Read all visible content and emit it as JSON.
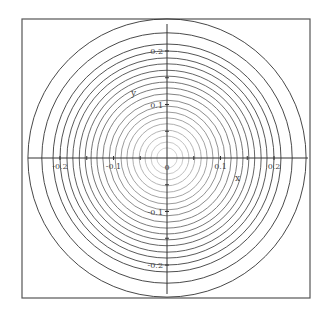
{
  "chart_data": {
    "type": "contour",
    "title": "",
    "xlabel": "x",
    "ylabel": "y",
    "xlim": [
      -0.26,
      0.26
    ],
    "ylim": [
      -0.26,
      0.26
    ],
    "grid": false,
    "legend": null,
    "x_ticks": [
      -0.2,
      -0.15,
      -0.1,
      -0.05,
      0,
      0.05,
      0.1,
      0.15,
      0.2
    ],
    "x_tick_labels": [
      "-0.2",
      "-0.1",
      "0",
      "0.1",
      "0.2"
    ],
    "x_tick_label_values": [
      -0.2,
      -0.1,
      0,
      0.1,
      0.2
    ],
    "y_tick_labels": [
      "0.2",
      "0.1",
      "-0.1",
      "-0.2"
    ],
    "y_tick_label_values": [
      0.2,
      0.1,
      -0.1,
      -0.2
    ],
    "contours": {
      "shape": "concentric circles centered at origin",
      "radii": [
        0.26,
        0.234,
        0.213,
        0.2,
        0.187,
        0.176,
        0.164,
        0.153,
        0.142,
        0.131,
        0.12,
        0.108,
        0.097,
        0.086,
        0.075,
        0.064,
        0.052,
        0.041,
        0.03,
        0.019
      ],
      "outer_color": "#333333",
      "inner_color": "#cccccc"
    }
  },
  "labels": {
    "x_axis": "x",
    "y_axis": "y",
    "origin": "0"
  },
  "colors": {
    "frame": "#555555",
    "axes": "#333333",
    "background": "#ffffff"
  }
}
